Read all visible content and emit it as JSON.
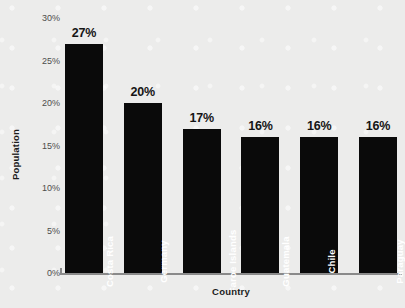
{
  "chart_data": {
    "type": "bar",
    "title": "",
    "xlabel": "Country",
    "ylabel": "Population",
    "categories": [
      "Costa Rica",
      "Germany",
      "Faroe Islands",
      "Guatemala",
      "Chile",
      "Paraguay"
    ],
    "values": [
      27,
      20,
      17,
      16,
      16,
      16
    ],
    "value_labels": [
      "27%",
      "20%",
      "17%",
      "16%",
      "16%",
      "16%"
    ],
    "ylim": [
      0,
      30
    ],
    "yticks": [
      0,
      5,
      10,
      15,
      20,
      25,
      30
    ],
    "ytick_labels": [
      "0%",
      "5%",
      "10%",
      "15%",
      "20%",
      "25%",
      "30%"
    ],
    "grid": false,
    "legend": "none",
    "bar_color": "#0a0a0a",
    "background_color": "#ececeb",
    "axis_color": "#8a8a8a",
    "label_color": "#ffffff",
    "value_label_color": "#151515",
    "tick_label_color": "#4c4c4c"
  }
}
